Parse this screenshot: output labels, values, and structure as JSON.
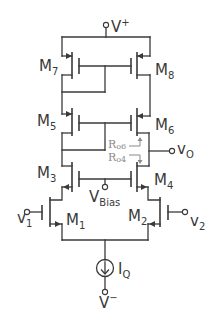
{
  "diagram": {
    "supplies": {
      "positive": {
        "main": "V",
        "sup": "+"
      },
      "negative": {
        "main": "V",
        "sup": "−"
      }
    },
    "transistors": [
      {
        "id": "M1",
        "main": "M",
        "sub": "1",
        "type": "nmos"
      },
      {
        "id": "M2",
        "main": "M",
        "sub": "2",
        "type": "nmos"
      },
      {
        "id": "M3",
        "main": "M",
        "sub": "3",
        "type": "nmos"
      },
      {
        "id": "M4",
        "main": "M",
        "sub": "4",
        "type": "nmos"
      },
      {
        "id": "M5",
        "main": "M",
        "sub": "5",
        "type": "pmos"
      },
      {
        "id": "M6",
        "main": "M",
        "sub": "6",
        "type": "pmos"
      },
      {
        "id": "M7",
        "main": "M",
        "sub": "7",
        "type": "pmos"
      },
      {
        "id": "M8",
        "main": "M",
        "sub": "8",
        "type": "pmos"
      }
    ],
    "inputs": {
      "v1": {
        "main": "v",
        "sub": "1"
      },
      "v2": {
        "main": "v",
        "sub": "2"
      },
      "vbias": {
        "main": "V",
        "sub": "Bias"
      }
    },
    "output": {
      "main": "v",
      "sub": "O"
    },
    "current_source": {
      "main": "I",
      "sub": "Q"
    },
    "resistances": [
      {
        "id": "Ro6",
        "main": "R",
        "sub": "o6",
        "direction": "up"
      },
      {
        "id": "Ro4",
        "main": "R",
        "sub": "o4",
        "direction": "down"
      }
    ]
  }
}
